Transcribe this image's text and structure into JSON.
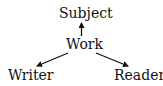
{
  "diagram": {
    "nodes": {
      "subject": "Subject",
      "work": "Work",
      "writer": "Writer",
      "reader": "Reader"
    },
    "edges": [
      {
        "from": "Work",
        "to": "Subject"
      },
      {
        "from": "Work",
        "to": "Writer"
      },
      {
        "from": "Work",
        "to": "Reader"
      }
    ],
    "colors": {
      "text": "#111111",
      "arrow": "#111111",
      "background": "#ffffff"
    }
  }
}
